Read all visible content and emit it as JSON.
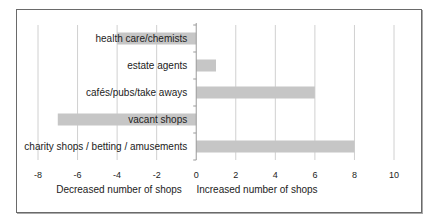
{
  "chart_data": {
    "type": "bar",
    "orientation": "horizontal",
    "title": "",
    "categories": [
      "health care/chemists",
      "estate agents",
      "cafés/pubs/take aways",
      "vacant shops",
      "charity shops / betting / amusements"
    ],
    "values": [
      -4,
      1,
      6,
      -7,
      8
    ],
    "xlabel_left": "Decreased number of shops",
    "xlabel_right": "Increased number of shops",
    "xlim": [
      -8,
      10
    ],
    "xticks": [
      -8,
      -6,
      -4,
      -2,
      0,
      2,
      4,
      6,
      8,
      10
    ],
    "xtick_labels": [
      "-8",
      "-6",
      "-4",
      "-2",
      "0",
      "2",
      "4",
      "6",
      "8",
      "10"
    ],
    "grid": true,
    "legend": "none",
    "bar_color": "#c6c6c6"
  }
}
